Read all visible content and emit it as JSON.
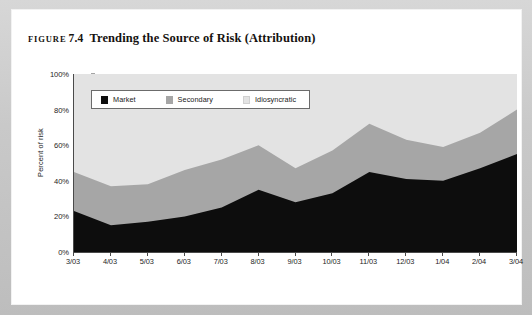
{
  "figure": {
    "label_word": "FIGURE",
    "number": "7.4",
    "caption": "Trending the Source of Risk (Attribution)"
  },
  "chart_data": {
    "type": "area",
    "title": "Trending the Source of Risk (Attribution)",
    "xlabel": "",
    "ylabel": "Percent of risk",
    "ylim": [
      0,
      100
    ],
    "ytick_labels": [
      "0%",
      "20%",
      "40%",
      "60%",
      "80%",
      "100%"
    ],
    "ytick_values": [
      0,
      20,
      40,
      60,
      80,
      100
    ],
    "grid": false,
    "stacked": true,
    "legend_position": "top-left-inside",
    "categories": [
      "3/03",
      "4/03",
      "5/03",
      "6/03",
      "7/03",
      "8/03",
      "9/03",
      "10/03",
      "11/03",
      "12/03",
      "1/04",
      "2/04",
      "3/04"
    ],
    "series": [
      {
        "name": "Market",
        "color": "#0d0d0d",
        "values": [
          23,
          15,
          17,
          20,
          25,
          35,
          28,
          33,
          45,
          41,
          40,
          47,
          55
        ]
      },
      {
        "name": "Secondary",
        "color": "#a6a6a6",
        "values": [
          22,
          22,
          21,
          26,
          27,
          25,
          19,
          24,
          27,
          22,
          19,
          20,
          25
        ]
      },
      {
        "name": "Idiosyncratic",
        "color": "#e3e3e3",
        "values": [
          55,
          63,
          62,
          54,
          48,
          40,
          53,
          43,
          28,
          37,
          41,
          33,
          20
        ]
      }
    ],
    "cumulative": {
      "market_top": [
        23,
        15,
        17,
        20,
        25,
        35,
        28,
        33,
        45,
        41,
        40,
        47,
        55
      ],
      "secondary_top": [
        45,
        37,
        38,
        46,
        52,
        60,
        47,
        57,
        72,
        63,
        59,
        67,
        80
      ],
      "idiosyncratic_top": [
        100,
        100,
        100,
        100,
        100,
        100,
        100,
        100,
        100,
        100,
        100,
        100,
        100
      ]
    }
  },
  "legend": {
    "items": [
      {
        "label": "Market",
        "color": "#0d0d0d"
      },
      {
        "label": "Secondary",
        "color": "#a6a6a6"
      },
      {
        "label": "Idiosyncratic",
        "color": "#e3e3e3"
      }
    ]
  }
}
